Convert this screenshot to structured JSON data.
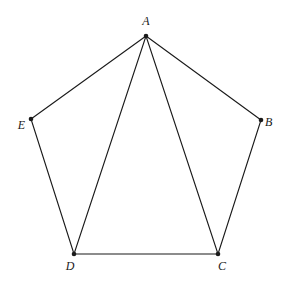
{
  "diagram": {
    "type": "geometry",
    "shape": "pentagon",
    "points": {
      "A": {
        "label": "A",
        "x": 146,
        "y": 36,
        "label_x": 146,
        "label_y": 25,
        "anchor": "middle"
      },
      "B": {
        "label": "B",
        "x": 261,
        "y": 120,
        "label_x": 265,
        "label_y": 126,
        "anchor": "start"
      },
      "C": {
        "label": "C",
        "x": 218,
        "y": 254,
        "label_x": 222,
        "label_y": 270,
        "anchor": "middle"
      },
      "D": {
        "label": "D",
        "x": 74,
        "y": 254,
        "label_x": 70,
        "label_y": 270,
        "anchor": "middle"
      },
      "E": {
        "label": "E",
        "x": 31,
        "y": 119,
        "label_x": 25,
        "label_y": 129,
        "anchor": "end"
      }
    },
    "segments": [
      {
        "from": "A",
        "to": "B",
        "kind": "side"
      },
      {
        "from": "B",
        "to": "C",
        "kind": "side"
      },
      {
        "from": "C",
        "to": "D",
        "kind": "side"
      },
      {
        "from": "D",
        "to": "E",
        "kind": "side"
      },
      {
        "from": "E",
        "to": "A",
        "kind": "side"
      },
      {
        "from": "A",
        "to": "D",
        "kind": "diagonal"
      },
      {
        "from": "A",
        "to": "C",
        "kind": "diagonal"
      }
    ],
    "colors": {
      "stroke": "#1a1a1a",
      "background": "#ffffff"
    }
  }
}
